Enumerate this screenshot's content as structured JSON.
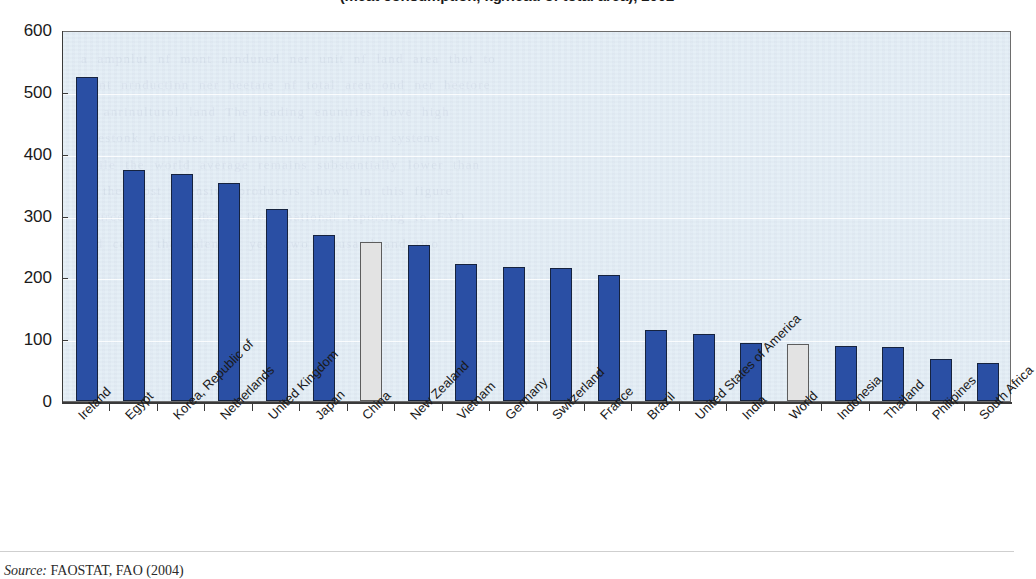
{
  "chart_data": {
    "type": "bar",
    "title": "(meat consumption, kg/head of total area), 2002",
    "xlabel": "",
    "ylabel": "",
    "ylim": [
      0,
      600
    ],
    "ytick_step": 100,
    "yticks": [
      0,
      100,
      200,
      300,
      400,
      500,
      600
    ],
    "grid": true,
    "legend": "none",
    "categories": [
      "Ireland",
      "Egypt",
      "Korea, Republic of",
      "Netherlands",
      "United Kingdom",
      "Japan",
      "China",
      "New Zealand",
      "Vietnam",
      "Germany",
      "Switzerland",
      "France",
      "Brazil",
      "United States of America",
      "India",
      "World",
      "Indonesia",
      "Thailand",
      "Philipines",
      "South Africa"
    ],
    "values": [
      524,
      373,
      367,
      353,
      311,
      269,
      257,
      253,
      222,
      217,
      215,
      203,
      115,
      108,
      94,
      92,
      89,
      87,
      68,
      61
    ],
    "highlighted": [
      "China",
      "World"
    ],
    "colors": {
      "bar": "#2a4fa4",
      "bar_highlight": "#e3e3e3",
      "bar_edge": "#16233f",
      "bar_highlight_edge": "#5d5d5d",
      "plot_background": "#e3edf6",
      "gridline": "#ffffff",
      "axis": "#3a3a3a",
      "text": "#1a1a1a"
    }
  },
  "source": {
    "lead": "Source:",
    "text": " FAOSTAT, FAO (2004)"
  },
  "ghost": {
    "lines": [
      "a ampnlut nf mont nrnduned ner unit nf land area thot to",
      "ment nrnductinn ner heetare nf total aren ond ner heetore",
      "nf anrinulturol land The leading enuntries hove high",
      "livestonk densities and intensive production systems",
      "while the world average remains substantially lower than",
      "in the most intensive producers shown in this figure",
      "Source data are drawn from national reporting to FAO",
      "and cover the calendar year two thousand and two"
    ]
  }
}
